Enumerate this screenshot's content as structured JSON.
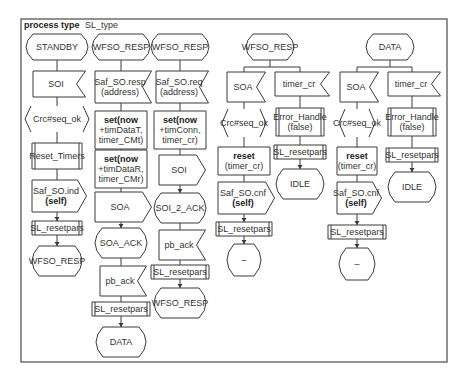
{
  "diagram": {
    "title_keyword": "process type",
    "title_name": "SL_type",
    "frame": {
      "x": 21,
      "y": 19,
      "w": 426,
      "h": 343
    },
    "colors": {
      "stroke": "#3a3a3a",
      "fill": "#ffffff",
      "text": "#333333"
    },
    "columns": [
      {
        "id": "col1",
        "cx": 57,
        "nodes": [
          {
            "type": "state",
            "y": 34,
            "h": 26,
            "w": 62,
            "lines": [
              "STANDBY"
            ]
          },
          {
            "type": "input",
            "y": 71,
            "h": 26,
            "w": 48,
            "lines": [
              "SOI"
            ]
          },
          {
            "type": "decision",
            "y": 106,
            "h": 26,
            "w": 62,
            "lines": [
              "Crc#seq_ok"
            ]
          },
          {
            "type": "procedure",
            "y": 143,
            "h": 26,
            "w": 50,
            "lines": [
              "Reset_Timers"
            ]
          },
          {
            "type": "output",
            "y": 180,
            "h": 32,
            "w": 50,
            "lines": [
              "Saf_SO.ind",
              "(self)"
            ],
            "bold": [
              false,
              true
            ]
          },
          {
            "type": "procedure",
            "y": 221,
            "h": 14,
            "w": 50,
            "lines": [
              "SL_resetpars"
            ]
          },
          {
            "type": "state",
            "y": 246,
            "h": 30,
            "w": 50,
            "lines": [
              "WFSO_RESP"
            ]
          }
        ]
      },
      {
        "id": "col2",
        "cx": 121,
        "nodes": [
          {
            "type": "state",
            "y": 34,
            "h": 26,
            "w": 58,
            "lines": [
              "WFSO_RESP"
            ]
          },
          {
            "type": "input",
            "y": 71,
            "h": 32,
            "w": 52,
            "lines": [
              "Saf_SO.resp",
              "(address)"
            ]
          },
          {
            "type": "task",
            "y": 111,
            "h": 38,
            "w": 52,
            "lines": [
              "set(now",
              "+timDataT,",
              "timer_CMt)"
            ],
            "boldFirst": true
          },
          {
            "type": "task",
            "y": 150,
            "h": 38,
            "w": 52,
            "lines": [
              "set(now",
              "+timDataR,",
              "timer_CMr)"
            ],
            "boldFirst": true
          },
          {
            "type": "output",
            "y": 192,
            "h": 30,
            "w": 52,
            "lines": [
              "SOA"
            ]
          },
          {
            "type": "state",
            "y": 228,
            "h": 30,
            "w": 52,
            "lines": [
              "SOA_ACK"
            ]
          },
          {
            "type": "input",
            "y": 266,
            "h": 30,
            "w": 42,
            "lines": [
              "pb_ack"
            ]
          },
          {
            "type": "procedure",
            "y": 302,
            "h": 14,
            "w": 58,
            "lines": [
              "SL_resetpars"
            ]
          },
          {
            "type": "state",
            "y": 327,
            "h": 30,
            "w": 50,
            "lines": [
              "DATA"
            ]
          }
        ]
      },
      {
        "id": "col3",
        "cx": 180,
        "nodes": [
          {
            "type": "state",
            "y": 34,
            "h": 26,
            "w": 58,
            "lines": [
              "WFSO_RESP"
            ]
          },
          {
            "type": "input",
            "y": 71,
            "h": 32,
            "w": 48,
            "lines": [
              "Saf_SO.req",
              "(address)"
            ]
          },
          {
            "type": "task",
            "y": 111,
            "h": 38,
            "w": 52,
            "lines": [
              "set(now",
              "+timConn,",
              "timer_cr)"
            ],
            "boldFirst": true
          },
          {
            "type": "output",
            "y": 155,
            "h": 30,
            "w": 42,
            "lines": [
              "SOI"
            ]
          },
          {
            "type": "state",
            "y": 193,
            "h": 30,
            "w": 52,
            "lines": [
              "SOI_2_ACK"
            ]
          },
          {
            "type": "input",
            "y": 230,
            "h": 30,
            "w": 42,
            "lines": [
              "pb_ack"
            ]
          },
          {
            "type": "procedure",
            "y": 265,
            "h": 14,
            "w": 58,
            "lines": [
              "SL_resetpars"
            ]
          },
          {
            "type": "state",
            "y": 288,
            "h": 30,
            "w": 52,
            "lines": [
              "WFSO_RESP"
            ]
          }
        ]
      }
    ],
    "branch_groups": [
      {
        "id": "grp4",
        "state": {
          "cx": 270,
          "y": 34,
          "h": 26,
          "w": 48,
          "lines": [
            "WFSO_RESP"
          ]
        },
        "branch_y": 67,
        "branches": [
          {
            "cx": 244,
            "nodes": [
              {
                "type": "input",
                "y": 72,
                "h": 30,
                "w": 34,
                "lines": [
                  "SOA"
                ]
              },
              {
                "type": "decision",
                "y": 109,
                "h": 28,
                "w": 42,
                "lines": [
                  "Crc#seq_ok"
                ]
              },
              {
                "type": "task",
                "y": 147,
                "h": 28,
                "w": 52,
                "lines": [
                  "reset",
                  "(timer_cr)"
                ],
                "boldFirst": true
              },
              {
                "type": "output",
                "y": 182,
                "h": 32,
                "w": 52,
                "lines": [
                  "Saf_SO.cnf",
                  "(self)"
                ],
                "bold": [
                  false,
                  true
                ]
              },
              {
                "type": "procedure",
                "y": 222,
                "h": 14,
                "w": 56,
                "lines": [
                  "SL_resetpars"
                ]
              },
              {
                "type": "state",
                "y": 244,
                "h": 32,
                "w": 34,
                "lines": [
                  "–"
                ]
              }
            ]
          },
          {
            "cx": 300,
            "nodes": [
              {
                "type": "input",
                "y": 72,
                "h": 24,
                "w": 50,
                "lines": [
                  "timer_cr"
                ]
              },
              {
                "type": "procedure",
                "y": 108,
                "h": 28,
                "w": 48,
                "lines": [
                  "Error_Handle",
                  "(false)"
                ]
              },
              {
                "type": "procedure",
                "y": 145,
                "h": 14,
                "w": 52,
                "lines": [
                  "SL_resetpars"
                ]
              },
              {
                "type": "state",
                "y": 169,
                "h": 30,
                "w": 48,
                "lines": [
                  "IDLE"
                ]
              }
            ]
          }
        ]
      },
      {
        "id": "grp5",
        "state": {
          "cx": 390,
          "y": 34,
          "h": 26,
          "w": 48,
          "lines": [
            "DATA"
          ]
        },
        "branch_y": 67,
        "branches": [
          {
            "cx": 357,
            "nodes": [
              {
                "type": "input",
                "y": 72,
                "h": 30,
                "w": 34,
                "lines": [
                  "SOA"
                ]
              },
              {
                "type": "decision",
                "y": 109,
                "h": 28,
                "w": 34,
                "lines": [
                  "Crc#seq_ok"
                ]
              },
              {
                "type": "task",
                "y": 147,
                "h": 28,
                "w": 40,
                "lines": [
                  "reset",
                  "(timer_cr)"
                ],
                "boldFirst": true
              },
              {
                "type": "output",
                "y": 182,
                "h": 32,
                "w": 40,
                "lines": [
                  "Saf_SO.cnf",
                  "(self)"
                ],
                "bold": [
                  false,
                  true
                ]
              },
              {
                "type": "procedure",
                "y": 225,
                "h": 14,
                "w": 58,
                "lines": [
                  "SL_resetpars"
                ]
              },
              {
                "type": "state",
                "y": 248,
                "h": 32,
                "w": 36,
                "lines": [
                  "–"
                ]
              }
            ]
          },
          {
            "cx": 412,
            "nodes": [
              {
                "type": "input",
                "y": 72,
                "h": 24,
                "w": 48,
                "lines": [
                  "timer_cr"
                ]
              },
              {
                "type": "procedure",
                "y": 108,
                "h": 28,
                "w": 48,
                "lines": [
                  "Error_Handle",
                  "(false)"
                ]
              },
              {
                "type": "procedure",
                "y": 148,
                "h": 14,
                "w": 52,
                "lines": [
                  "SL_resetpars"
                ]
              },
              {
                "type": "state",
                "y": 172,
                "h": 30,
                "w": 48,
                "lines": [
                  "IDLE"
                ]
              }
            ]
          }
        ]
      }
    ]
  }
}
